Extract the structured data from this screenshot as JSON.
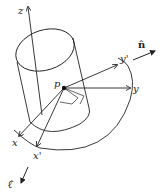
{
  "diagram": {
    "labels": {
      "z": "z",
      "p": "p",
      "y": "y",
      "y_prime": "y'",
      "x": "x",
      "x_prime": "x'",
      "n_hat": "n̂",
      "l_hat": "ℓ̂"
    },
    "colors": {
      "line": "#222222",
      "background": "#ffffff"
    }
  }
}
